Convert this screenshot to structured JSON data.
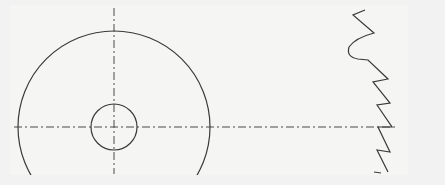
{
  "drawing": {
    "type": "gear-sketch",
    "colors": {
      "background": "#f2f2f2",
      "sheet": "#f5f5f4",
      "line": "#3a3a3a",
      "centerline": "#4a4a4a"
    },
    "center": [
      114,
      127
    ],
    "outer_circle_radius": 96,
    "inner_circle_radius": 23,
    "horizontal_centerline": {
      "x1": 14,
      "x2": 396,
      "y": 127
    },
    "vertical_centerline": {
      "x": 114,
      "y1": 8,
      "y2": 174
    },
    "tooth_profile": "M365,10 L353,15 L374,33 Q355,38 349,47 Q346,57 358,59 L368,60 L388,79 L373,82 L390,103 L377,105 L392,127 L378,127 L390,152 L377,150 L388,172",
    "tooth_tick": "M374,172 L381,173"
  }
}
